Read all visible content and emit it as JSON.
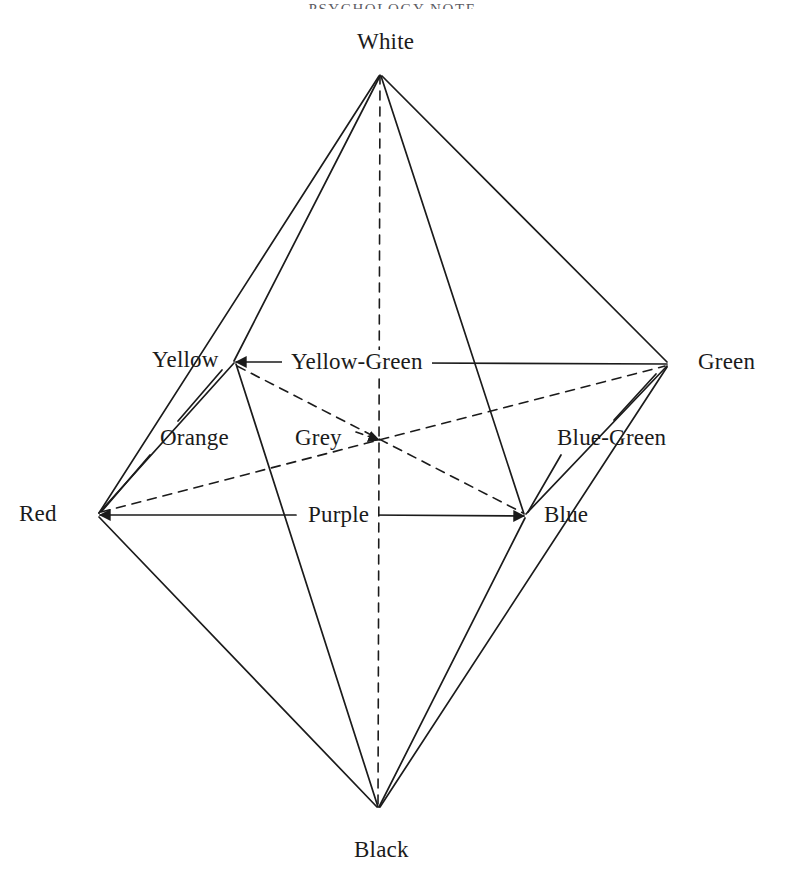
{
  "page": {
    "running_head": "PSYCHOLOGY NOTE",
    "background_color": "#ffffff",
    "ink_color": "#1b1b1b"
  },
  "figure": {
    "kind": "color-octahedron",
    "vertices": [
      {
        "id": "white",
        "label": "White",
        "x": 380,
        "y": 75,
        "label_x": 353,
        "label_y": 30
      },
      {
        "id": "yellow",
        "label": "Yellow",
        "x": 235,
        "y": 362,
        "label_x": 148,
        "label_y": 348
      },
      {
        "id": "green",
        "label": "Green",
        "x": 668,
        "y": 364,
        "label_x": 694,
        "label_y": 350
      },
      {
        "id": "red",
        "label": "Red",
        "x": 98,
        "y": 515,
        "label_x": 15,
        "label_y": 502
      },
      {
        "id": "blue",
        "label": "Blue",
        "x": 525,
        "y": 516,
        "label_x": 540,
        "label_y": 503
      },
      {
        "id": "black",
        "label": "Black",
        "x": 378,
        "y": 808,
        "label_x": 350,
        "label_y": 838
      }
    ],
    "center": {
      "id": "grey",
      "label": "Grey",
      "x": 381,
      "y": 441
    },
    "edge_labels": [
      {
        "id": "yellow-green",
        "label": "Yellow-Green",
        "between": [
          "yellow",
          "green"
        ],
        "style": "solid-inline"
      },
      {
        "id": "purple",
        "label": "Purple",
        "between": [
          "red",
          "blue"
        ],
        "style": "solid-inline"
      },
      {
        "id": "orange",
        "label": "Orange",
        "between": [
          "red",
          "yellow"
        ],
        "style": "solid-leader"
      },
      {
        "id": "blue-green",
        "label": "Blue-Green",
        "between": [
          "blue",
          "green"
        ],
        "style": "solid-leader"
      },
      {
        "id": "grey",
        "label": "Grey",
        "between": [
          "center"
        ],
        "style": "dashed-leader"
      }
    ],
    "solid_edges": [
      [
        "white",
        "yellow"
      ],
      [
        "white",
        "red"
      ],
      [
        "white",
        "blue"
      ],
      [
        "white",
        "green"
      ],
      [
        "yellow",
        "red"
      ],
      [
        "yellow",
        "black"
      ],
      [
        "red",
        "black"
      ],
      [
        "blue",
        "black"
      ],
      [
        "blue",
        "green"
      ],
      [
        "green",
        "black"
      ],
      [
        "red",
        "blue"
      ],
      [
        "yellow",
        "green"
      ]
    ],
    "dashed_edges": [
      [
        "white",
        "black"
      ],
      [
        "yellow",
        "blue"
      ],
      [
        "red",
        "green"
      ]
    ]
  }
}
